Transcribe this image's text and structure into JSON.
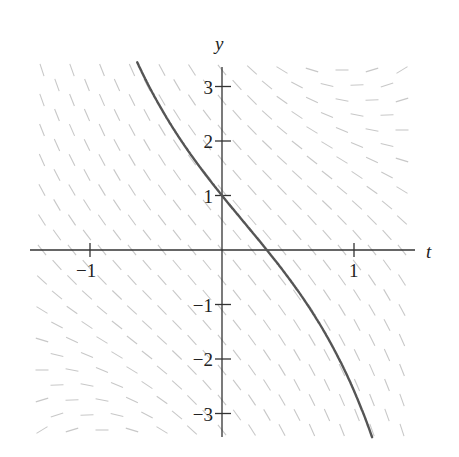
{
  "chart_data": {
    "type": "line",
    "title": "",
    "subtitle": "Direction field with solution curve",
    "xlabel": "t",
    "ylabel": "y",
    "xlim": [
      -1.5,
      1.45
    ],
    "ylim": [
      -3.4,
      3.4
    ],
    "grid": false,
    "legend": null,
    "x_ticks": [
      {
        "value": -1,
        "label": "−1"
      },
      {
        "value": 1,
        "label": "1"
      }
    ],
    "y_ticks": [
      {
        "value": 3,
        "label": "3"
      },
      {
        "value": 2,
        "label": "2"
      },
      {
        "value": 1,
        "label": "1"
      },
      {
        "value": -1,
        "label": "−1"
      },
      {
        "value": -2,
        "label": "−2"
      },
      {
        "value": -3,
        "label": "−3"
      }
    ],
    "slope_field": {
      "equation_estimate": "dy/dt = t*y - 3",
      "color": "#c8c8c8",
      "t_range": [
        -1.38,
        1.45
      ],
      "y_range": [
        -3.4,
        3.4
      ]
    },
    "series": [
      {
        "name": "solution through (0, 1)",
        "color": "#555555",
        "initial_condition": {
          "t": 0,
          "y": 1
        },
        "t_start": -0.66,
        "t_end": 1.37,
        "points": [
          {
            "t": -0.66,
            "y": 3.4
          },
          {
            "t": -0.5,
            "y": 2.75
          },
          {
            "t": -0.25,
            "y": 1.83
          },
          {
            "t": 0,
            "y": 1
          },
          {
            "t": 0.34,
            "y": 0
          },
          {
            "t": 0.5,
            "y": -0.5
          },
          {
            "t": 0.75,
            "y": -1.3
          },
          {
            "t": 1.0,
            "y": -2.15
          },
          {
            "t": 1.25,
            "y": -2.95
          },
          {
            "t": 1.37,
            "y": -3.4
          }
        ]
      }
    ]
  },
  "axes": {
    "t_label": "t",
    "y_label": "y"
  },
  "colors": {
    "axis": "#333333",
    "curve": "#555555",
    "field": "#c8c8c8",
    "text": "#222222"
  }
}
